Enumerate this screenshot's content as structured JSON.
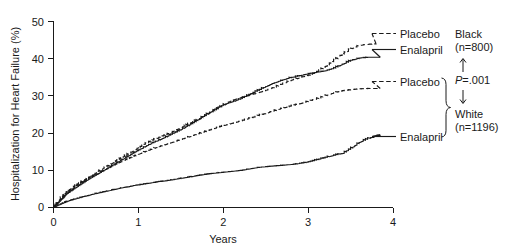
{
  "chart_data": {
    "type": "line",
    "title": "",
    "xlabel": "Years",
    "ylabel": "Hospitalization for Heart Failure (%)",
    "xlim": [
      0,
      4
    ],
    "ylim": [
      0,
      50
    ],
    "xticks": [
      "0",
      "1",
      "2",
      "3",
      "4"
    ],
    "yticks": [
      "0",
      "10",
      "20",
      "30",
      "40",
      "50"
    ],
    "grid": false,
    "legend_position": "right-inline",
    "annotations": {
      "group_black": "Black",
      "group_black_n": "(n=800)",
      "group_white": "White",
      "group_white_n": "(n=1196)",
      "pvalue": "P=.001",
      "pvalue_prefix": "P",
      "pvalue_suffix": "=.001"
    },
    "series": [
      {
        "name": "Black Placebo",
        "label": "Placebo",
        "group": "Black",
        "style": "dashed",
        "label_x": 400,
        "label_y": 37,
        "x": [
          0,
          0.04,
          0.08,
          0.12,
          0.16,
          0.22,
          0.28,
          0.34,
          0.4,
          0.46,
          0.52,
          0.58,
          0.64,
          0.7,
          0.76,
          0.82,
          0.88,
          0.94,
          1.0,
          1.08,
          1.16,
          1.24,
          1.32,
          1.4,
          1.48,
          1.56,
          1.64,
          1.72,
          1.8,
          1.88,
          1.96,
          2.04,
          2.12,
          2.2,
          2.3,
          2.4,
          2.5,
          2.6,
          2.7,
          2.8,
          2.9,
          3.0,
          3.1,
          3.2,
          3.3,
          3.4,
          3.5,
          3.6,
          3.7,
          3.8
        ],
        "y": [
          0,
          1.1,
          2.2,
          3.1,
          4.0,
          5.1,
          6.1,
          7.0,
          7.9,
          8.8,
          9.7,
          10.5,
          11.3,
          12.1,
          12.9,
          13.7,
          14.5,
          15.3,
          16.2,
          17.2,
          18.1,
          18.9,
          19.6,
          20.4,
          21.3,
          22.2,
          23.1,
          24.0,
          25.0,
          26.0,
          27.1,
          28.2,
          29.0,
          29.6,
          30.2,
          30.9,
          31.6,
          32.4,
          33.4,
          34.3,
          35.0,
          35.6,
          36.6,
          38.0,
          39.6,
          41.3,
          42.7,
          43.6,
          43.9,
          44.0
        ]
      },
      {
        "name": "Black Enalapril",
        "label": "Enalapril",
        "group": "Black",
        "style": "solid",
        "label_x": 400,
        "label_y": 53,
        "x": [
          0,
          0.04,
          0.08,
          0.12,
          0.16,
          0.22,
          0.28,
          0.34,
          0.4,
          0.46,
          0.52,
          0.58,
          0.64,
          0.7,
          0.76,
          0.82,
          0.88,
          0.94,
          1.0,
          1.08,
          1.16,
          1.24,
          1.32,
          1.4,
          1.48,
          1.56,
          1.64,
          1.72,
          1.8,
          1.88,
          1.96,
          2.04,
          2.12,
          2.2,
          2.3,
          2.4,
          2.5,
          2.6,
          2.7,
          2.8,
          2.9,
          3.0,
          3.1,
          3.2,
          3.3,
          3.4,
          3.5,
          3.6,
          3.7,
          3.85
        ],
        "y": [
          0,
          1.0,
          1.9,
          2.9,
          3.8,
          4.8,
          5.7,
          6.6,
          7.5,
          8.3,
          9.1,
          9.9,
          10.7,
          11.5,
          12.3,
          13.1,
          13.9,
          14.7,
          15.5,
          16.5,
          17.4,
          18.2,
          19.0,
          19.9,
          20.8,
          21.8,
          22.8,
          23.9,
          25.1,
          26.2,
          27.2,
          28.0,
          28.6,
          29.3,
          30.4,
          31.5,
          32.6,
          33.6,
          34.4,
          35.0,
          35.5,
          36.0,
          36.4,
          36.8,
          37.5,
          38.6,
          39.6,
          40.2,
          40.4,
          40.4
        ]
      },
      {
        "name": "White Placebo",
        "label": "Placebo",
        "group": "White",
        "style": "dashed",
        "label_x": 400,
        "label_y": 85,
        "x": [
          0,
          0.04,
          0.08,
          0.12,
          0.16,
          0.22,
          0.28,
          0.34,
          0.4,
          0.46,
          0.52,
          0.58,
          0.64,
          0.7,
          0.76,
          0.82,
          0.88,
          0.94,
          1.0,
          1.08,
          1.16,
          1.24,
          1.32,
          1.4,
          1.48,
          1.56,
          1.64,
          1.72,
          1.8,
          1.88,
          1.96,
          2.04,
          2.12,
          2.2,
          2.3,
          2.4,
          2.5,
          2.6,
          2.7,
          2.8,
          2.9,
          3.0,
          3.1,
          3.2,
          3.3,
          3.4,
          3.5,
          3.6,
          3.7,
          3.85
        ],
        "y": [
          0,
          1.3,
          2.5,
          3.5,
          4.4,
          5.4,
          6.3,
          7.1,
          7.8,
          8.5,
          9.2,
          9.9,
          10.6,
          11.3,
          12.0,
          12.6,
          13.2,
          13.8,
          14.4,
          15.1,
          15.8,
          16.4,
          17.0,
          17.6,
          18.2,
          18.8,
          19.4,
          20.0,
          20.6,
          21.2,
          21.8,
          22.3,
          22.8,
          23.3,
          24.0,
          24.7,
          25.4,
          26.1,
          26.8,
          27.4,
          28.0,
          28.6,
          29.3,
          30.1,
          30.9,
          31.4,
          31.7,
          31.9,
          32.0,
          32.0
        ]
      },
      {
        "name": "White Enalapril",
        "label": "Enalapril",
        "group": "White",
        "style": "solid",
        "label_x": 400,
        "label_y": 140,
        "x": [
          0,
          0.04,
          0.08,
          0.12,
          0.16,
          0.22,
          0.28,
          0.34,
          0.4,
          0.46,
          0.52,
          0.58,
          0.64,
          0.7,
          0.76,
          0.82,
          0.88,
          0.94,
          1.0,
          1.08,
          1.16,
          1.24,
          1.32,
          1.4,
          1.48,
          1.56,
          1.64,
          1.72,
          1.8,
          1.88,
          1.96,
          2.04,
          2.12,
          2.2,
          2.3,
          2.4,
          2.5,
          2.6,
          2.7,
          2.8,
          2.9,
          3.0,
          3.1,
          3.2,
          3.3,
          3.4,
          3.5,
          3.6,
          3.7,
          3.85
        ],
        "y": [
          0,
          0.5,
          0.9,
          1.3,
          1.7,
          2.1,
          2.5,
          2.9,
          3.2,
          3.6,
          3.9,
          4.2,
          4.5,
          4.8,
          5.1,
          5.4,
          5.6,
          5.9,
          6.1,
          6.4,
          6.7,
          7.0,
          7.2,
          7.5,
          7.8,
          8.1,
          8.4,
          8.7,
          9.0,
          9.2,
          9.4,
          9.6,
          9.8,
          10.0,
          10.4,
          10.8,
          11.0,
          11.2,
          11.4,
          11.6,
          11.9,
          12.3,
          12.9,
          13.5,
          14.1,
          14.6,
          16.0,
          17.6,
          18.6,
          19.6
        ]
      }
    ]
  }
}
